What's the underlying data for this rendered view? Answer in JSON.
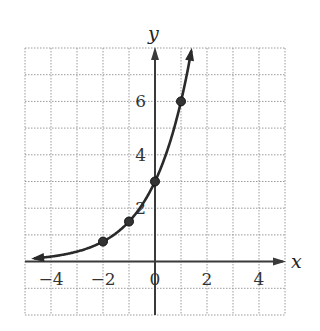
{
  "chart_data": {
    "type": "line",
    "title": "",
    "xlabel": "x",
    "ylabel": "y",
    "xlim": [
      -5,
      5
    ],
    "ylim": [
      -2,
      8
    ],
    "grid": true,
    "x_ticks": [
      -4,
      -2,
      0,
      2,
      4
    ],
    "x_tick_labels": [
      "−4",
      "−2",
      "0",
      "2",
      "4"
    ],
    "y_ticks": [
      2,
      4,
      6
    ],
    "y_tick_labels": [
      "2",
      "4",
      "6"
    ],
    "function": "y = 3 * 2^x",
    "marked_points": [
      {
        "x": -2,
        "y": 0.75
      },
      {
        "x": -1,
        "y": 1.5
      },
      {
        "x": 0,
        "y": 3
      },
      {
        "x": 1,
        "y": 6
      }
    ],
    "curve_arrows": [
      "left",
      "up"
    ],
    "colors": {
      "curve": "#2a2a2a",
      "grid": "#9a9a9a",
      "axis": "#3a3a3a"
    }
  }
}
